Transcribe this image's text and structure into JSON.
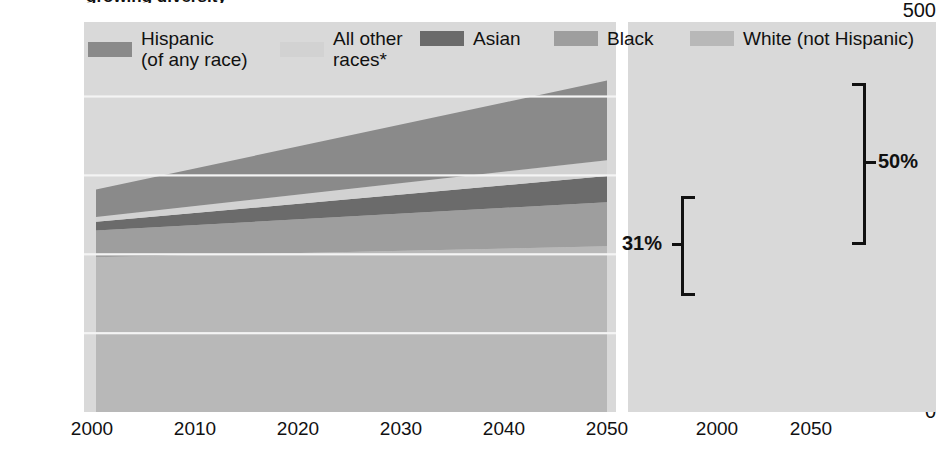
{
  "title": "growing diversity",
  "axis": {
    "y_unit": "million",
    "y_ticks": [
      "500",
      "400",
      "300",
      "200",
      "100",
      "0"
    ],
    "y_values": [
      500,
      400,
      300,
      200,
      100,
      0
    ],
    "area_x_ticks": [
      "2000",
      "2010",
      "2020",
      "2030",
      "2040",
      "2050"
    ],
    "bar_x_ticks": [
      "2000",
      "2050"
    ]
  },
  "legend": {
    "items": [
      {
        "label_line1": "Hispanic",
        "label_line2": "(of any race)",
        "color": "#8a8a8a"
      },
      {
        "label_line1": "All other",
        "label_line2": "races*",
        "color": "#d2d2d2"
      },
      {
        "label_line1": "Asian",
        "label_line2": "",
        "color": "#6b6b6b"
      },
      {
        "label_line1": "Black",
        "label_line2": "",
        "color": "#9e9e9e"
      },
      {
        "label_line1": "White (not Hispanic)",
        "label_line2": "",
        "color": "#b8b8b8"
      }
    ]
  },
  "annotations": [
    {
      "name": "minority-share-2000",
      "text": "31%"
    },
    {
      "name": "minority-share-2050",
      "text": "50%"
    }
  ],
  "chart_data": {
    "type": "area",
    "title": "growing diversity",
    "xlabel": "",
    "ylabel": "million",
    "ylim": [
      0,
      500
    ],
    "grid": true,
    "legend_position": "top",
    "x": [
      2000,
      2050
    ],
    "categories": [
      "2000",
      "2050"
    ],
    "stack_order_bottom_to_top": [
      "White (not Hispanic)",
      "Black",
      "Asian",
      "All other races*",
      "Hispanic (of any race)"
    ],
    "series": [
      {
        "name": "White (not Hispanic)",
        "color": "#b8b8b8",
        "values": [
          196,
          210
        ]
      },
      {
        "name": "Black",
        "color": "#9e9e9e",
        "values": [
          34,
          56
        ]
      },
      {
        "name": "Asian",
        "color": "#6b6b6b",
        "values": [
          11,
          33
        ]
      },
      {
        "name": "All other races*",
        "color": "#d2d2d2",
        "values": [
          6,
          20
        ]
      },
      {
        "name": "Hispanic (of any race)",
        "color": "#8a8a8a",
        "values": [
          35,
          101
        ]
      }
    ],
    "totals": [
      282,
      420
    ],
    "minority_share_percent": [
      31,
      50
    ],
    "bar_panel": {
      "type": "bar",
      "categories": [
        "2000",
        "2050"
      ],
      "series": [
        {
          "name": "White (not Hispanic)",
          "color": "#b8b8b8",
          "values": [
            196,
            210
          ]
        },
        {
          "name": "Black",
          "color": "#9e9e9e",
          "values": [
            34,
            56
          ]
        },
        {
          "name": "Asian",
          "color": "#6b6b6b",
          "values": [
            11,
            33
          ]
        },
        {
          "name": "All other races*",
          "color": "#d2d2d2",
          "values": [
            6,
            20
          ]
        },
        {
          "name": "Hispanic (of any race)",
          "color": "#8a8a8a",
          "values": [
            35,
            101
          ]
        }
      ]
    }
  }
}
